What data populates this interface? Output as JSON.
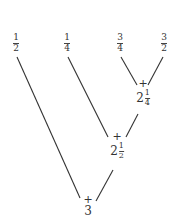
{
  "leaves": [
    {
      "num": "1",
      "den": "2"
    },
    {
      "num": "1",
      "den": "4"
    },
    {
      "num": "3",
      "den": "4"
    },
    {
      "num": "3",
      "den": "2"
    }
  ],
  "nodes": [
    {
      "op": "+",
      "whole": "2",
      "num": "1",
      "den": "4"
    },
    {
      "op": "+",
      "whole": "2",
      "num": "1",
      "den": "2"
    },
    {
      "op": "+",
      "whole": "3"
    }
  ],
  "colors": {
    "line": "#333333",
    "text": "#333333"
  }
}
